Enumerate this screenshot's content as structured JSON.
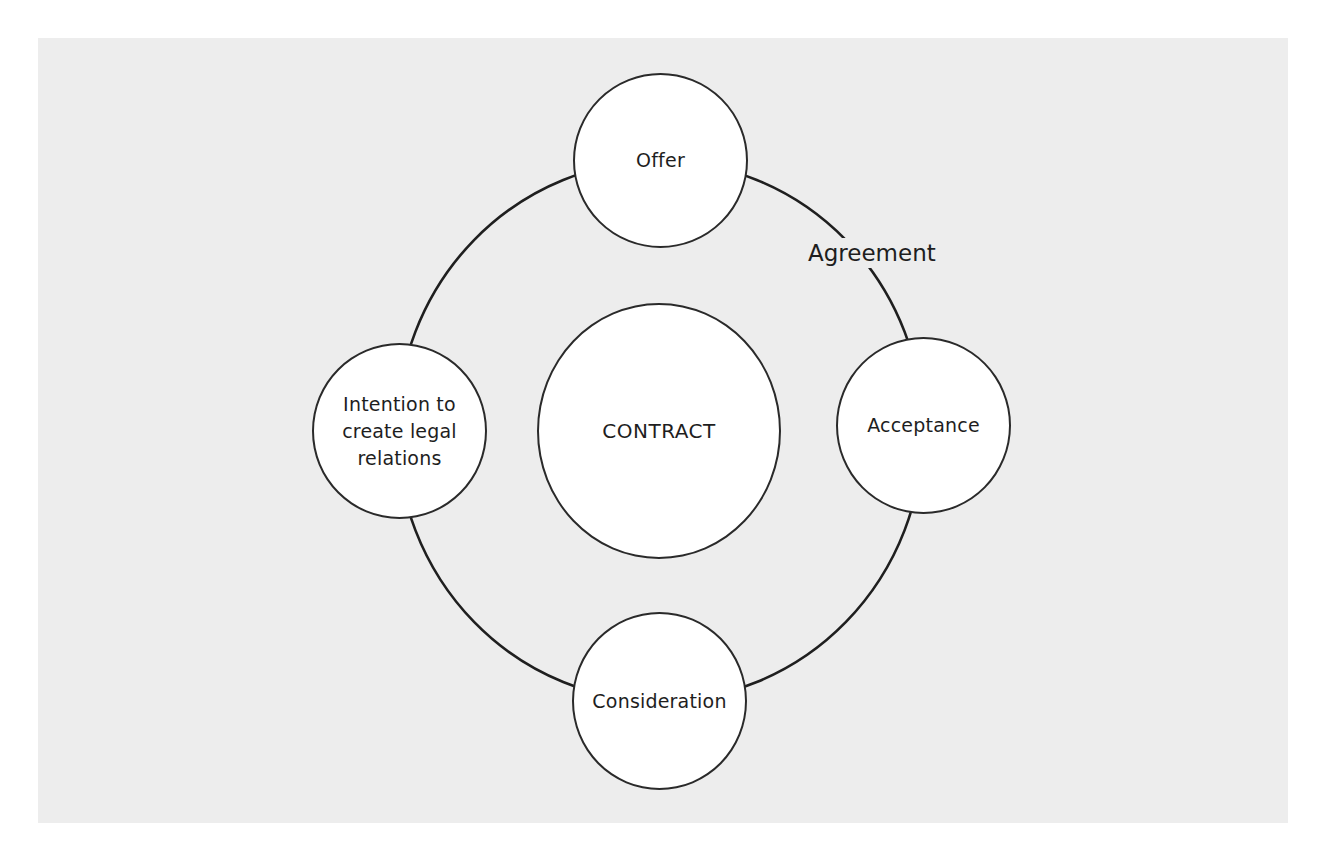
{
  "diagram": {
    "type": "cycle",
    "center": {
      "label": "CONTRACT"
    },
    "nodes": [
      {
        "id": "offer",
        "label": "Offer"
      },
      {
        "id": "acceptance",
        "label": "Acceptance"
      },
      {
        "id": "consideration",
        "label": "Consideration"
      },
      {
        "id": "intention",
        "label": "Intention to\ncreate legal\nrelations"
      }
    ],
    "arc_label": {
      "text": "Agreement",
      "between": [
        "offer",
        "acceptance"
      ]
    },
    "colors": {
      "background_panel": "#ededed",
      "node_fill": "#ffffff",
      "stroke": "#2a2a2a",
      "text": "#1e1e1e"
    }
  }
}
